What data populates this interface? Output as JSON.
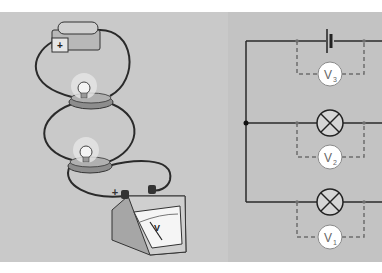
{
  "figure": {
    "left_illustration": {
      "battery": {
        "terminal_label": "+"
      },
      "bulbs": [
        "bulb-top",
        "bulb-bottom"
      ],
      "voltmeter": {
        "face_label": "V",
        "terminal_label": "+"
      }
    },
    "schematic": {
      "voltmeters": [
        {
          "id": "V3",
          "main": "V",
          "sub": "3"
        },
        {
          "id": "V2",
          "main": "V",
          "sub": "2"
        },
        {
          "id": "V1",
          "main": "V",
          "sub": "1"
        }
      ]
    }
  },
  "colors": {
    "left_bg": "#c9c9c9",
    "right_bg": "#c3c3c3",
    "wire": "#2a2a2a",
    "dashed": "#6e6e6e",
    "meter_fill": "#ffffff",
    "lamp_fill": "#d6d6d6"
  }
}
